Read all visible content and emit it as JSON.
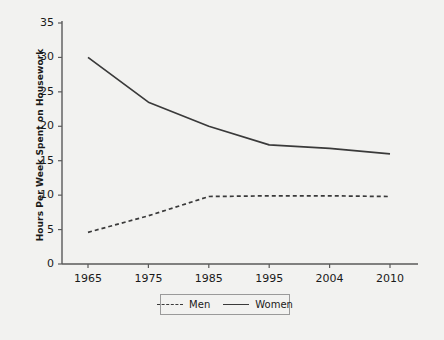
{
  "chart_data": {
    "type": "line",
    "title": "",
    "xlabel": "",
    "ylabel": "Hours Per Week Spent on Housework",
    "categories": [
      "1965",
      "1975",
      "1985",
      "1995",
      "2004",
      "2010"
    ],
    "series": [
      {
        "name": "Men",
        "values": [
          4.6,
          7.0,
          9.8,
          9.9,
          9.9,
          9.8
        ],
        "style": "dashed"
      },
      {
        "name": "Women",
        "values": [
          30.0,
          23.5,
          20.0,
          17.3,
          16.8,
          16.0
        ],
        "style": "solid"
      }
    ],
    "ylim": [
      0,
      35
    ],
    "yticks": [
      "0",
      "5",
      "10",
      "15",
      "20",
      "25",
      "30",
      "35"
    ],
    "grid": false,
    "legend_position": "bottom-center",
    "line_color": "#3a3a3a",
    "background_color": "#f2f2f0",
    "axis_color": "#5a5a5a"
  },
  "legend": {
    "men_label": "Men",
    "women_label": "Women"
  }
}
